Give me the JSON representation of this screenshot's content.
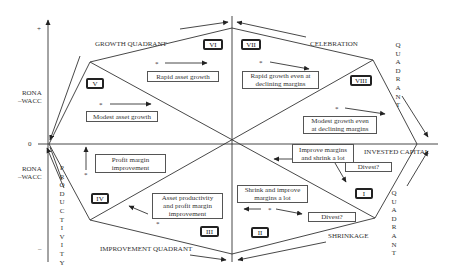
{
  "axes": {
    "y_axis_label_upper": "RONA\n–WACC",
    "y_axis_label_lower": "RONA\n–WACC",
    "y_plus": "+",
    "y_minus": "–",
    "origin": "0",
    "x_axis_label": "INVESTED CAPITAL"
  },
  "quadrants": {
    "growth": "GROWTH QUADRANT",
    "celebration": "CELEBRATION",
    "celebration_quadrant_vertical": "Q\nU\nA\nD\nR\nA\nN\nT",
    "improvement": "IMPROVEMENT QUADRANT",
    "productivity_vertical": "P\nR\nO\nD\nU\nC\nT\nI\nV\nI\nT\nY",
    "shrinkage": "SHRINKAGE",
    "shrinkage_quadrant_vertical": "Q\nU\nA\nD\nR\nA\nN\nT"
  },
  "sectors": [
    {
      "id": "I",
      "label": "I"
    },
    {
      "id": "II",
      "label": "II"
    },
    {
      "id": "III",
      "label": "III"
    },
    {
      "id": "IV",
      "label": "IV"
    },
    {
      "id": "V",
      "label": "V"
    },
    {
      "id": "VI",
      "label": "VI"
    },
    {
      "id": "VII",
      "label": "VII"
    },
    {
      "id": "VIII",
      "label": "VIII"
    }
  ],
  "strategies": {
    "rapid_asset_growth": "Rapid asset growth",
    "modest_asset_growth": "Modest asset growth",
    "rapid_growth_declining": "Rapid growth even at declining margins",
    "modest_growth_declining": "Modest growth even at declining margins",
    "profit_margin_improvement": "Profit margin improvement",
    "asset_productivity": "Asset productivity and profit margin improvement",
    "improve_margins_shrink": "Improve margins and shrink a lot",
    "divest_1": "Divest?",
    "shrink_improve": "Shrink and improve margins a lot",
    "divest_2": "Divest?"
  },
  "markers": {
    "star": "*"
  }
}
